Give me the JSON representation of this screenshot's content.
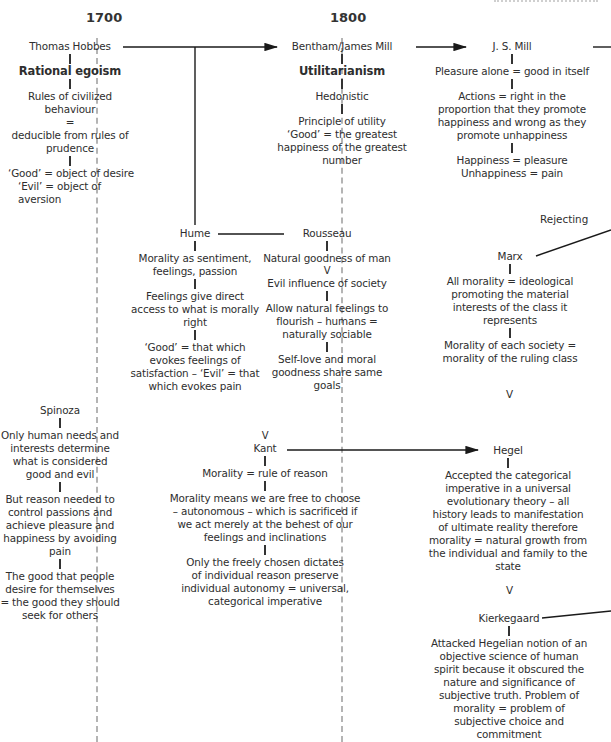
{
  "timeline": {
    "years": [
      "1700",
      "1800"
    ],
    "guide_color": "#b4b4b4",
    "text_color": "#2e2e2e",
    "line_color": "#1a1a1a"
  },
  "header_fragment": "Antecedents",
  "nodes": {
    "hobbes": {
      "name": "Thomas Hobbes",
      "school": "Rational egoism",
      "points": [
        "Rules of civilized behaviour",
        "=",
        "deducible from rules of prudence"
      ],
      "definitions": [
        "‘Good’ = object of desire",
        "‘Evil’ = object of aversion"
      ]
    },
    "bentham": {
      "name": "Bentham/James Mill",
      "school": "Utilitarianism",
      "points": [
        "Hedonistic",
        "Principle of utility",
        "‘Good’ = the greatest happiness of the greatest number"
      ]
    },
    "jsmill": {
      "name": "J. S. Mill",
      "points": [
        "Pleasure alone = good in itself",
        "Actions = right in the proportion that they promote happiness and wrong as they promote unhappiness",
        "Happiness = pleasure",
        "Unhappiness = pain"
      ]
    },
    "hume": {
      "name": "Hume",
      "points": [
        "Morality as sentiment, feelings, passion",
        "Feelings give direct access to what is morally right",
        "‘Good’ = that which evokes feelings of satisfaction – ‘Evil’ = that which evokes pain"
      ]
    },
    "rousseau": {
      "name": "Rousseau",
      "points": [
        "Natural goodness of man",
        "V",
        "Evil influence of society",
        "Allow natural feelings to flourish – humans = naturally sociable",
        "Self-love and moral goodness share same goals"
      ]
    },
    "marx": {
      "name": "Marx",
      "relation": "Rejecting",
      "points": [
        "All morality = ideological promoting the material interests of the class it represents",
        "Morality of each society = morality of the ruling class"
      ]
    },
    "spinoza": {
      "name": "Spinoza",
      "points": [
        "Only human needs and interests determine what is considered good and evil",
        "But reason needed to control passions and achieve pleasure and happiness by avoiding pain",
        "The good that people desire for themselves = the good they should seek for others"
      ]
    },
    "kant": {
      "name": "Kant",
      "points": [
        "Morality = rule of reason",
        "Morality means we are free to choose – autonomous – which is sacrificed if we act merely at the behest of our feelings and inclinations",
        "Only the freely chosen dictates of individual reason preserve individual autonomy = universal, categorical imperative"
      ]
    },
    "hegel": {
      "name": "Hegel",
      "points": [
        "Accepted the categorical imperative in a universal evolutionary theory – all history leads to manifestation of ultimate reality therefore morality = natural growth from the individual and family to the state"
      ]
    },
    "kierkegaard": {
      "name": "Kierkegaard",
      "points": [
        "Attacked Hegelian notion of an objective science of human spirit because it obscured the nature and significance of subjective truth. Problem of morality = problem of subjective choice and commitment"
      ]
    }
  },
  "connector_glyph": "V"
}
